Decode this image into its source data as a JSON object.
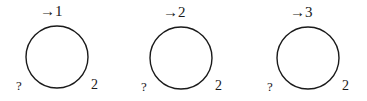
{
  "diagrams": [
    {
      "top_label": "→1",
      "left_label": "?",
      "right_label": "2",
      "cx": 57,
      "cy": 57
    },
    {
      "top_label": "→2",
      "left_label": "?",
      "right_label": "2",
      "cx": 181,
      "cy": 58
    },
    {
      "top_label": "→3",
      "left_label": "?",
      "right_label": "2",
      "cx": 308,
      "cy": 58
    }
  ],
  "style": {
    "stroke": "#1a1a1a",
    "radius": 31
  }
}
